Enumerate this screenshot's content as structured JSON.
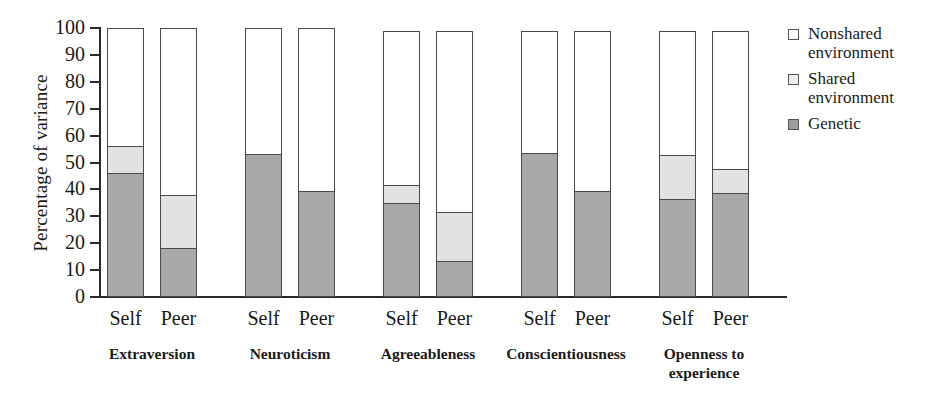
{
  "chart_data": {
    "type": "bar",
    "subtype": "stacked-bar",
    "title": "",
    "xlabel": "",
    "ylabel": "Percentage of variance",
    "ylim": [
      0,
      100
    ],
    "yticks": [
      0,
      10,
      20,
      30,
      40,
      50,
      60,
      70,
      80,
      90,
      100
    ],
    "grid": false,
    "legend_position": "right",
    "stack_order_bottom_to_top": [
      "Genetic",
      "Shared environment",
      "Nonshared environment"
    ],
    "legend": [
      {
        "key": "nonshared",
        "label_line1": "Nonshared",
        "label_line2": "environment",
        "color": "#ffffff"
      },
      {
        "key": "shared",
        "label_line1": "Shared",
        "label_line2": "environment",
        "color": "#ededed"
      },
      {
        "key": "genetic",
        "label_line1": "Genetic",
        "label_line2": "",
        "color": "#9d9d9d"
      }
    ],
    "groups": [
      {
        "name": "Extraversion",
        "name_line1": "Extraversion",
        "name_line2": "",
        "bars": [
          {
            "label": "Self",
            "genetic": 46,
            "shared": 10,
            "nonshared": 44,
            "total": 100
          },
          {
            "label": "Peer",
            "genetic": 18,
            "shared": 20,
            "nonshared": 62,
            "total": 100
          }
        ]
      },
      {
        "name": "Neuroticism",
        "name_line1": "Neuroticism",
        "name_line2": "",
        "bars": [
          {
            "label": "Self",
            "genetic": 53,
            "shared": 0,
            "nonshared": 47,
            "total": 100
          },
          {
            "label": "Peer",
            "genetic": 39.5,
            "shared": 0,
            "nonshared": 60.5,
            "total": 100
          }
        ]
      },
      {
        "name": "Agreeableness",
        "name_line1": "Agreeableness",
        "name_line2": "",
        "bars": [
          {
            "label": "Self",
            "genetic": 35,
            "shared": 6.5,
            "nonshared": 57.5,
            "total": 99
          },
          {
            "label": "Peer",
            "genetic": 13,
            "shared": 18.5,
            "nonshared": 67.5,
            "total": 99
          }
        ]
      },
      {
        "name": "Conscientiousness",
        "name_line1": "Conscientiousness",
        "name_line2": "",
        "bars": [
          {
            "label": "Self",
            "genetic": 53.5,
            "shared": 0,
            "nonshared": 45.5,
            "total": 99
          },
          {
            "label": "Peer",
            "genetic": 39.5,
            "shared": 0,
            "nonshared": 59.5,
            "total": 99
          }
        ]
      },
      {
        "name": "Openness to experience",
        "name_line1": "Openness to",
        "name_line2": "experience",
        "bars": [
          {
            "label": "Self",
            "genetic": 36.5,
            "shared": 16.5,
            "nonshared": 46,
            "total": 99
          },
          {
            "label": "Peer",
            "genetic": 38.5,
            "shared": 9,
            "nonshared": 51.5,
            "total": 99
          }
        ]
      }
    ]
  },
  "colors": {
    "genetic": "#a8a8a8",
    "shared": "#e2e2e2",
    "nonshared": "#ffffff",
    "axis": "#2a2a2a",
    "outline": "#4a4a4a"
  }
}
